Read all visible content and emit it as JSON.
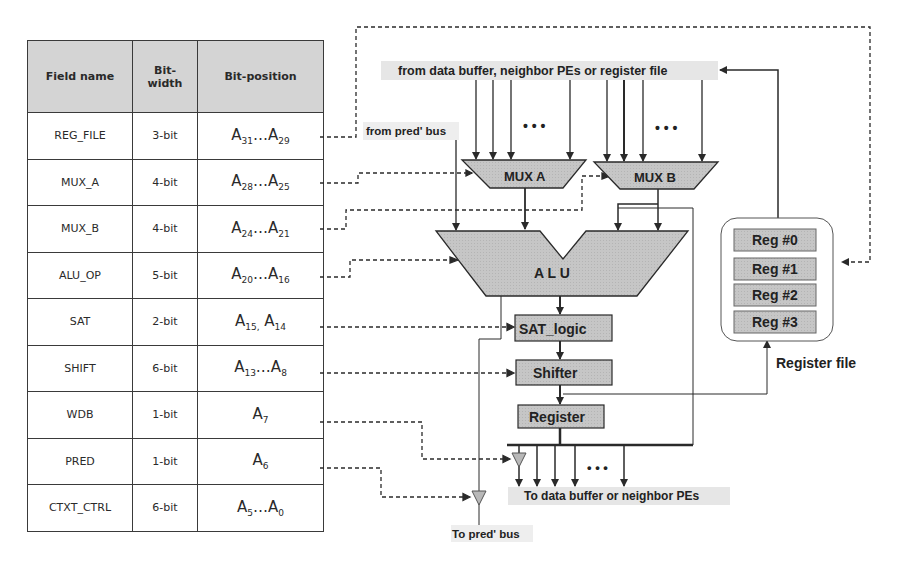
{
  "table": {
    "headers": [
      "Field name",
      "Bit-width",
      "Bit-position"
    ],
    "rows": [
      {
        "field": "REG_FILE",
        "width": "3-bit",
        "pos": [
          [
            "A",
            "31"
          ],
          [
            "…",
            ""
          ],
          [
            "A",
            "29"
          ]
        ]
      },
      {
        "field": "MUX_A",
        "width": "4-bit",
        "pos": [
          [
            "A",
            "28"
          ],
          [
            "…",
            ""
          ],
          [
            "A",
            "25"
          ]
        ]
      },
      {
        "field": "MUX_B",
        "width": "4-bit",
        "pos": [
          [
            "A",
            "24"
          ],
          [
            "…",
            ""
          ],
          [
            "A",
            "21"
          ]
        ]
      },
      {
        "field": "ALU_OP",
        "width": "5-bit",
        "pos": [
          [
            "A",
            "20"
          ],
          [
            "…",
            ""
          ],
          [
            "A",
            "16"
          ]
        ]
      },
      {
        "field": "SAT",
        "width": "2-bit",
        "pos": [
          [
            "A",
            "15,"
          ],
          [
            " ",
            ""
          ],
          [
            "A",
            "14"
          ]
        ]
      },
      {
        "field": "SHIFT",
        "width": "6-bit",
        "pos": [
          [
            "A",
            "13"
          ],
          [
            "…",
            ""
          ],
          [
            "A",
            "8"
          ]
        ]
      },
      {
        "field": "WDB",
        "width": "1-bit",
        "pos": [
          [
            "A",
            "7"
          ]
        ]
      },
      {
        "field": "PRED",
        "width": "1-bit",
        "pos": [
          [
            "A",
            "6"
          ]
        ]
      },
      {
        "field": "CTXT_CTRL",
        "width": "6-bit",
        "pos": [
          [
            "A",
            "5"
          ],
          [
            "…",
            ""
          ],
          [
            "A",
            "0"
          ]
        ]
      }
    ]
  },
  "diagram": {
    "input_bus_label": "from data buffer, neighbor PEs or register file",
    "pred_in_label": "from pred' bus",
    "mux_a": "MUX A",
    "mux_b": "MUX B",
    "alu": "A L U",
    "sat_logic": "SAT_logic",
    "shifter": "Shifter",
    "register": "Register",
    "ellipsis": "• • •",
    "output_bus_label": "To data buffer or neighbor PEs",
    "pred_out_label": "To pred' bus",
    "register_file": {
      "title": "Register file",
      "regs": [
        "Reg #0",
        "Reg #1",
        "Reg #2",
        "Reg #3"
      ]
    }
  },
  "colors": {
    "block_fill": "#c8c8c8",
    "label_bg": "#e6e6e6",
    "line": "#2a2a2a",
    "buffer_fill": "#b8b8b8"
  }
}
